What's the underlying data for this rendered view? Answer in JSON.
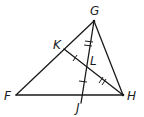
{
  "diagram": {
    "type": "triangle-geometry",
    "points": {
      "G": {
        "label": "G",
        "x": 94,
        "y": 21
      },
      "F": {
        "label": "F",
        "x": 16,
        "y": 95
      },
      "H": {
        "label": "H",
        "x": 123,
        "y": 95
      },
      "J": {
        "label": "J",
        "x": 81,
        "y": 95
      },
      "K": {
        "label": "K",
        "x": 64,
        "y": 49
      },
      "L": {
        "label": "L",
        "x": 86,
        "y": 67
      }
    },
    "segments": [
      "GF",
      "GH",
      "FH",
      "GJ",
      "KH"
    ],
    "congruence_marks": [
      {
        "segment": "GL",
        "ticks": 2
      },
      {
        "segment": "LH",
        "ticks": 2
      },
      {
        "segment": "KL",
        "ticks": 1
      },
      {
        "segment": "LJ",
        "ticks": 1
      }
    ],
    "colors": {
      "stroke": "#1a1a1a",
      "background": "#ffffff"
    }
  }
}
